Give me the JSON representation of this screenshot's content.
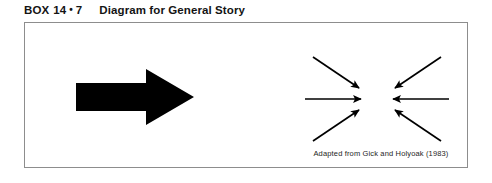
{
  "figure": {
    "label_word": "BOX",
    "label_number": "14",
    "label_separator": "•",
    "label_subnumber": "7",
    "title": "Diagram for General Story",
    "caption": "Adapted from Gick and Holyoak (1983)",
    "border_color": "#8d8d8d",
    "ink_color": "#000000",
    "background_color": "#ffffff"
  },
  "diagram": {
    "source_arrow": {
      "name": "large-right-arrow",
      "direction": "right",
      "style": "solid-block"
    },
    "convergence": {
      "name": "converging-arrows",
      "target_label": "central-convergence-point",
      "arrow_count": 6,
      "arrows": [
        {
          "name": "arrow-from-upper-left",
          "from": [
            12,
            6
          ],
          "to": [
            60,
            38
          ],
          "direction": "down-right"
        },
        {
          "name": "arrow-from-left",
          "from": [
            4,
            48
          ],
          "to": [
            62,
            48
          ],
          "direction": "right"
        },
        {
          "name": "arrow-from-lower-left",
          "from": [
            12,
            90
          ],
          "to": [
            60,
            58
          ],
          "direction": "up-right"
        },
        {
          "name": "arrow-from-upper-right",
          "from": [
            140,
            6
          ],
          "to": [
            92,
            38
          ],
          "direction": "down-left"
        },
        {
          "name": "arrow-from-right",
          "from": [
            148,
            48
          ],
          "to": [
            90,
            48
          ],
          "direction": "left"
        },
        {
          "name": "arrow-from-lower-right",
          "from": [
            140,
            90
          ],
          "to": [
            92,
            58
          ],
          "direction": "up-left"
        }
      ]
    }
  }
}
